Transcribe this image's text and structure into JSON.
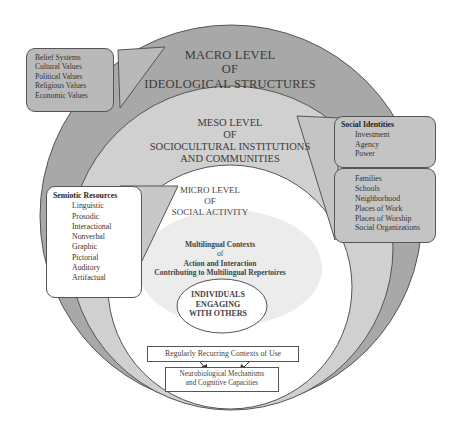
{
  "colors": {
    "macro_fill": "#a8a8a8",
    "meso_fill": "#cfcfcf",
    "micro_fill": "#ffffff",
    "context_cloud": "#ebebeb",
    "box_fill_dark": "#b9b9b9",
    "box_fill_light": "#d3d3d3",
    "outline": "#555555"
  },
  "macro": {
    "title_line1": "MACRO LEVEL",
    "title_line2": "OF",
    "title_line3": "IDEOLOGICAL STRUCTURES",
    "callout_items": [
      "Belief Systems",
      "Cultural Values",
      "Political Values",
      "Religious Values",
      "Economic Values"
    ]
  },
  "meso": {
    "title_line1": "MESO LEVEL",
    "title_line2": "OF",
    "title_line3": "SOCIOCULTURAL INSTITUTIONS",
    "title_line4": "AND COMMUNITIES",
    "social_identities": {
      "heading": "Social Identities",
      "items": [
        "Investment",
        "Agency",
        "Power"
      ]
    },
    "institutions": [
      "Families",
      "Schools",
      "Neighborhood",
      "Places of Work",
      "Places of Worship",
      "Social Organizations"
    ]
  },
  "micro": {
    "title_line1": "MICRO LEVEL",
    "title_line2": "OF",
    "title_line3": "SOCIAL ACTIVITY",
    "semiotic_resources": {
      "heading": "Semiotic Resources",
      "items": [
        "Linguistic",
        "Prosodic",
        "Interactional",
        "Nonverbal",
        "Graphic",
        "Pictorial",
        "Auditory",
        "Artifactual"
      ]
    },
    "contexts": {
      "line1": "Multilingual Contexts",
      "line2": "of",
      "line3": "Action and Interaction",
      "line4": "Contributing to Multilingual Repertoires"
    },
    "individuals": {
      "line1": "INDIVIDUALS",
      "line2": "ENGAGING",
      "line3": "WITH  OTHERS"
    },
    "recurring_contexts": "Regularly Recurring Contexts of Use",
    "neuro": {
      "line1": "Neurobiological Mechanisms",
      "line2": "and Cognitive Capacities"
    }
  }
}
